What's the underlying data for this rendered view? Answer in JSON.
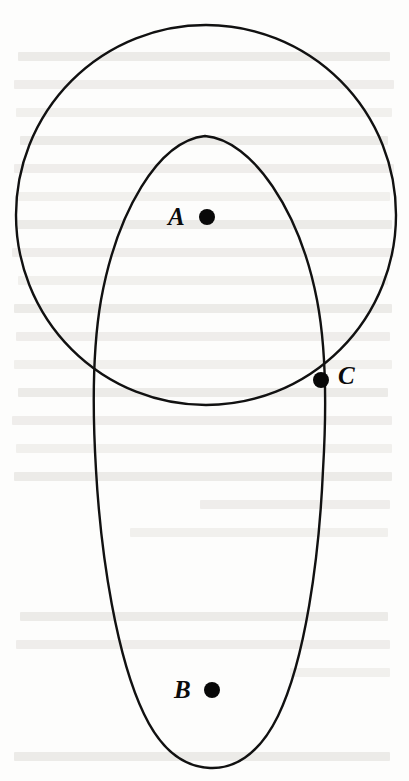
{
  "figure": {
    "background_color": "#fdfdfc",
    "stroke_color": "#111111",
    "dot_color": "#080808",
    "ghost_text_color": "#e9e7e4",
    "canvas": {
      "width": 409,
      "height": 781
    }
  },
  "shapes": [
    {
      "name": "circle",
      "type": "circle",
      "center_x": 206,
      "center_y": 215,
      "radius": 190,
      "stroke_width": 2.4
    },
    {
      "name": "oval",
      "type": "closed-curve",
      "apex_x": 205,
      "apex_y": 136,
      "bottom_x": 210,
      "bottom_y": 768,
      "left_x": 93,
      "right_x": 325,
      "widest_y": 440,
      "stroke_width": 2.4
    }
  ],
  "points": [
    {
      "id": "A",
      "label": "A",
      "dot_x": 207,
      "dot_y": 217,
      "dot_radius": 8,
      "label_x": 168,
      "label_y": 204,
      "inside": "both"
    },
    {
      "id": "B",
      "label": "B",
      "dot_x": 212,
      "dot_y": 690,
      "dot_radius": 8,
      "label_x": 174,
      "label_y": 677,
      "inside": "oval"
    },
    {
      "id": "C",
      "label": "C",
      "dot_x": 321,
      "dot_y": 380,
      "dot_radius": 8,
      "label_x": 338,
      "label_y": 363,
      "inside": "intersection"
    }
  ],
  "ghost_lines": [
    {
      "x": 18,
      "y": 52,
      "w": 372
    },
    {
      "x": 14,
      "y": 80,
      "w": 380
    },
    {
      "x": 16,
      "y": 108,
      "w": 376
    },
    {
      "x": 20,
      "y": 136,
      "w": 368
    },
    {
      "x": 14,
      "y": 164,
      "w": 380
    },
    {
      "x": 18,
      "y": 192,
      "w": 372
    },
    {
      "x": 16,
      "y": 220,
      "w": 376
    },
    {
      "x": 12,
      "y": 248,
      "w": 382
    },
    {
      "x": 18,
      "y": 276,
      "w": 370
    },
    {
      "x": 14,
      "y": 304,
      "w": 378
    },
    {
      "x": 16,
      "y": 332,
      "w": 374
    },
    {
      "x": 14,
      "y": 360,
      "w": 378
    },
    {
      "x": 18,
      "y": 388,
      "w": 370
    },
    {
      "x": 12,
      "y": 416,
      "w": 380
    },
    {
      "x": 16,
      "y": 444,
      "w": 376
    },
    {
      "x": 14,
      "y": 472,
      "w": 378
    },
    {
      "x": 200,
      "y": 500,
      "w": 190
    },
    {
      "x": 130,
      "y": 528,
      "w": 258
    },
    {
      "x": 20,
      "y": 612,
      "w": 368
    },
    {
      "x": 16,
      "y": 640,
      "w": 374
    },
    {
      "x": 290,
      "y": 668,
      "w": 100
    },
    {
      "x": 14,
      "y": 752,
      "w": 376
    }
  ]
}
